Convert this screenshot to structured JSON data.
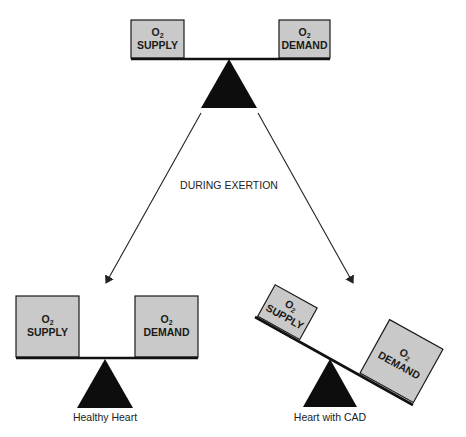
{
  "diagram": {
    "top_balance": {
      "left_box": {
        "line1": "O",
        "sub": "2",
        "line2": "SUPPLY"
      },
      "right_box": {
        "line1": "O",
        "sub": "2",
        "line2": "DEMAND"
      }
    },
    "transition_label": "DURING EXERTION",
    "healthy_balance": {
      "left_box": {
        "line1": "O",
        "sub": "2",
        "line2": "SUPPLY"
      },
      "right_box": {
        "line1": "O",
        "sub": "2",
        "line2": "DEMAND"
      },
      "caption": "Healthy Heart"
    },
    "cad_balance": {
      "left_box": {
        "line1": "O",
        "sub": "2",
        "line2": "SUPPLY"
      },
      "right_box": {
        "line1": "O",
        "sub": "2",
        "line2": "DEMAND"
      },
      "caption": "Heart with CAD"
    },
    "colors": {
      "box_fill": "#c9c9c9",
      "fulcrum": "#0d0d0d",
      "background": "#ffffff"
    }
  }
}
